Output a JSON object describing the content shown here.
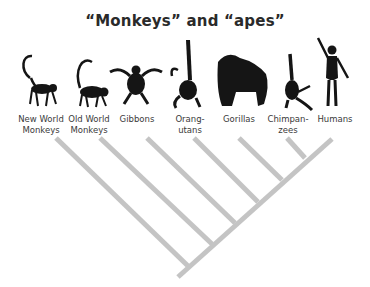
{
  "title": "“Monkeys” and “apes”",
  "colors": {
    "branch": "#c4c4c4",
    "silhouette": "#151515",
    "text": "#3a3a3a"
  },
  "taxa": [
    {
      "id": "new-world-monkeys",
      "label": "New World\nMonkeys",
      "icon": "new-world-monkey-silhouette-icon"
    },
    {
      "id": "old-world-monkeys",
      "label": "Old World\nMonkeys",
      "icon": "old-world-monkey-silhouette-icon"
    },
    {
      "id": "gibbons",
      "label": "Gibbons",
      "icon": "gibbon-silhouette-icon"
    },
    {
      "id": "orangutans",
      "label": "Orang-\nutans",
      "icon": "orangutan-silhouette-icon"
    },
    {
      "id": "gorillas",
      "label": "Gorillas",
      "icon": "gorilla-silhouette-icon"
    },
    {
      "id": "chimpanzees",
      "label": "Chimpan-\nzees",
      "icon": "chimpanzee-silhouette-icon"
    },
    {
      "id": "humans",
      "label": "Humans",
      "icon": "human-silhouette-icon"
    }
  ]
}
